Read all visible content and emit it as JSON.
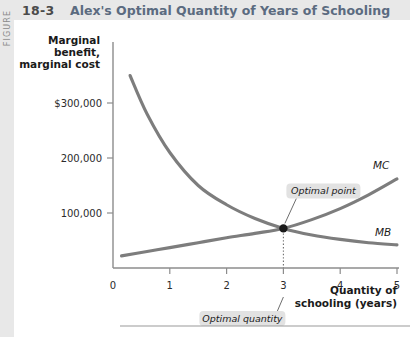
{
  "figure": {
    "strip_label": "FIGURE",
    "number": "18-3",
    "title": "Alex's Optimal Quantity of Years of Schooling"
  },
  "chart_data": {
    "type": "line",
    "title": "Alex's Optimal Quantity of Years of Schooling",
    "xlabel_line1": "Quantity of",
    "xlabel_line2": "schooling (years)",
    "ylabel_line1": "Marginal",
    "ylabel_line2": "benefit,",
    "ylabel_line3": "marginal cost",
    "xlim": [
      0,
      5
    ],
    "ylim": [
      0,
      400000
    ],
    "grid": false,
    "legend_position": "inline-right",
    "x_ticks": [
      "0",
      "1",
      "2",
      "3",
      "4",
      "5"
    ],
    "x_tick_values": [
      0,
      1,
      2,
      3,
      4,
      5
    ],
    "y_ticks": [
      "100,000",
      "200,000",
      "$300,000"
    ],
    "y_tick_values": [
      100000,
      200000,
      300000
    ],
    "series": [
      {
        "name": "MB",
        "label": "MB",
        "description": "marginal benefit, downward sloping",
        "x": [
          0.3,
          0.6,
          1.0,
          1.5,
          2.0,
          2.5,
          3.0,
          3.5,
          4.0,
          4.5,
          5.0
        ],
        "values": [
          350000,
          280000,
          210000,
          150000,
          115000,
          90000,
          72000,
          60000,
          52000,
          46000,
          42000
        ]
      },
      {
        "name": "MC",
        "label": "MC",
        "description": "marginal cost, upward sloping",
        "x": [
          0.15,
          0.6,
          1.0,
          1.5,
          2.0,
          2.5,
          3.0,
          3.5,
          4.0,
          4.5,
          5.0
        ],
        "values": [
          22000,
          30000,
          37000,
          46000,
          55000,
          63000,
          72000,
          88000,
          108000,
          133000,
          162000
        ]
      }
    ],
    "annotations": [
      {
        "name": "optimal-point",
        "label": "Optimal point",
        "x": 3.0,
        "y": 72000,
        "marker": "filled-circle"
      },
      {
        "name": "optimal-quantity",
        "label": "Optimal quantity",
        "x": 3.0,
        "y": 0
      }
    ]
  },
  "colors": {
    "curve": "#7d7d7d",
    "axis": "#8c8c8c",
    "title": "#5b6b80",
    "header_band": "#e8e8e8",
    "callout_bg": "#e2e2e2",
    "marker": "#1a1a1a"
  }
}
